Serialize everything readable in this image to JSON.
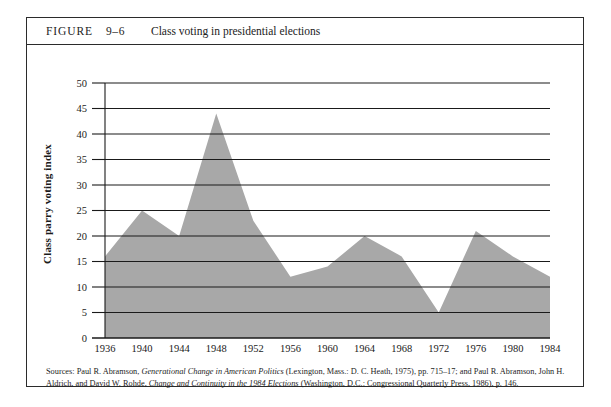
{
  "figure": {
    "label": "FIGURE",
    "number": "9–6",
    "title": "Class voting in presidential elections"
  },
  "source_note": {
    "lead": "Sources:",
    "part1": " Paul R. Abramson, ",
    "italic1": "Generational Change in American Politics",
    "part2": " (Lexington, Mass.: D. C. Heath, 1975), pp. 715–17; and Paul R. Abramson, John H. Aldrich, and David W. Rohde, ",
    "italic2": "Change and Continuity in the 1984 Elections",
    "part3": " (Washington, D.C.: Congressional Quarterly Press, 1986), p. 146."
  },
  "colors": {
    "area_fill": "#a8a8a8",
    "gridline": "#1a1a1a",
    "axis": "#1a1a1a",
    "frame": "#2b2b2b",
    "background": "#ffffff"
  },
  "chart_data": {
    "type": "area",
    "title": "Class voting in presidential elections",
    "xlabel": "",
    "ylabel": "Class parry voting index",
    "x": [
      1936,
      1940,
      1944,
      1948,
      1952,
      1956,
      1960,
      1964,
      1968,
      1972,
      1976,
      1980,
      1984
    ],
    "categories": [
      "1936",
      "1940",
      "1944",
      "1948",
      "1952",
      "1956",
      "1960",
      "1964",
      "1968",
      "1972",
      "1976",
      "1980",
      "1984"
    ],
    "values": [
      16,
      25,
      20,
      44,
      23,
      12,
      14,
      20,
      16,
      5,
      21,
      16,
      12
    ],
    "ylim": [
      0,
      50
    ],
    "yticks": [
      0,
      5,
      10,
      15,
      20,
      25,
      30,
      35,
      40,
      45,
      50
    ],
    "ytick_labels": [
      "0",
      "5",
      "10",
      "15",
      "20",
      "25",
      "30",
      "35",
      "40",
      "45",
      "50"
    ],
    "xtick_labels": [
      "1936",
      "1940",
      "1944",
      "1948",
      "1952",
      "1956",
      "1960",
      "1964",
      "1968",
      "1972",
      "1976",
      "1980",
      "1984"
    ],
    "grid": true,
    "legend": null
  }
}
